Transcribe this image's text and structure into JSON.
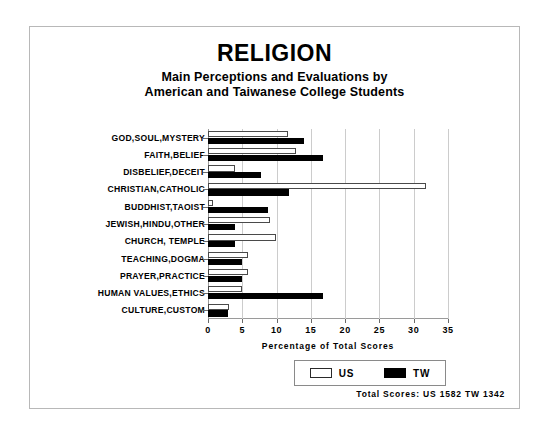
{
  "chart_data": {
    "type": "bar",
    "orientation": "horizontal",
    "title": "RELIGION",
    "subtitle_line1": "Main Perceptions and Evaluations by",
    "subtitle_line2": "American and Taiwanese College Students",
    "xlabel": "Percentage of Total Scores",
    "ylabel": "",
    "xlim": [
      0,
      35
    ],
    "xticks": [
      0,
      5,
      10,
      15,
      20,
      25,
      30,
      35
    ],
    "grid": true,
    "legend_position": "bottom-right",
    "categories": [
      "GOD,SOUL,MYSTERY",
      "FAITH,BELIEF",
      "DISBELIEF,DECEIT",
      "CHRISTIAN,CATHOLIC",
      "BUDDHIST,TAOIST",
      "JEWISH,HINDU,OTHER",
      "CHURCH, TEMPLE",
      "TEACHING,DOGMA",
      "PRAYER,PRACTICE",
      "HUMAN VALUES,ETHICS",
      "CULTURE,CUSTOM"
    ],
    "series": [
      {
        "name": "US",
        "color": "#ffffff",
        "edgecolor": "#000000",
        "values": [
          11.7,
          12.8,
          4.0,
          31.8,
          0.8,
          9.0,
          9.9,
          5.9,
          5.9,
          5.0,
          3.0
        ]
      },
      {
        "name": "TW",
        "color": "#000000",
        "edgecolor": "#000000",
        "values": [
          14.0,
          16.8,
          7.8,
          11.8,
          8.8,
          4.0,
          4.0,
          4.9,
          5.0,
          16.8,
          2.9
        ]
      }
    ],
    "annotations": {
      "totals": "Total Scores:  US 1582  TW 1342",
      "total_us": "1582",
      "total_tw": "1342"
    }
  },
  "legend": {
    "entries": [
      {
        "label": "US",
        "style": "open"
      },
      {
        "label": "TW",
        "style": "filled"
      }
    ]
  },
  "colors": {
    "us_fill": "#ffffff",
    "tw_fill": "#000000",
    "grid": "#cccccc",
    "frame": "#b8b8b8",
    "text": "#000000"
  }
}
